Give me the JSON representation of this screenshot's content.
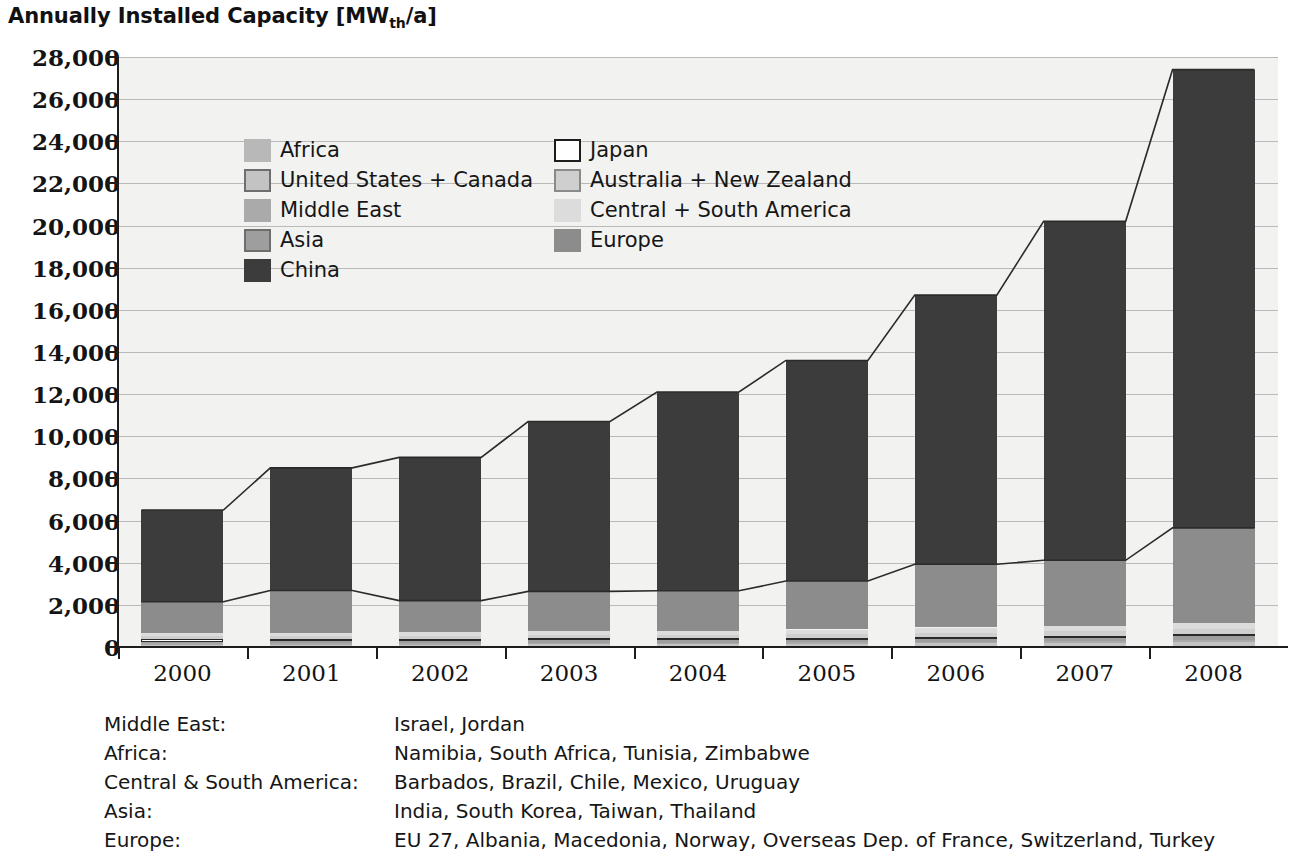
{
  "title": {
    "main": "Annually Installed Capacity [MW",
    "subscript": "th",
    "tail": "/a]"
  },
  "legend": {
    "left_column": [
      {
        "label": "Africa",
        "color": "#b8b8b8",
        "border": "none"
      },
      {
        "label": "United States + Canada",
        "color": "#c3c3c3",
        "border": "#6e6e6e"
      },
      {
        "label": "Middle East",
        "color": "#aaaaaa",
        "border": "none"
      },
      {
        "label": "Asia",
        "color": "#9e9e9e",
        "border": "#6e6e6e"
      },
      {
        "label": "China",
        "color": "#3c3c3c",
        "border": "none"
      }
    ],
    "right_column": [
      {
        "label": "Japan",
        "color": "#ffffff",
        "border": "#1d1d1d"
      },
      {
        "label": "Australia + New Zealand",
        "color": "#cfcfcf",
        "border": "#8a8a8a"
      },
      {
        "label": "Central + South America",
        "color": "#dcdcdc",
        "border": "none"
      },
      {
        "label": "Europe",
        "color": "#8c8c8c",
        "border": "none"
      }
    ]
  },
  "footnotes": [
    {
      "key": "Middle East:",
      "value": "Israel, Jordan"
    },
    {
      "key": "Africa:",
      "value": "Namibia, South Africa, Tunisia, Zimbabwe"
    },
    {
      "key": "Central & South America:",
      "value": "Barbados, Brazil, Chile, Mexico, Uruguay"
    },
    {
      "key": "Asia:",
      "value": "India, South Korea, Taiwan, Thailand"
    },
    {
      "key": "Europe:",
      "value": "EU 27, Albania, Macedonia, Norway, Overseas Dep. of France, Switzerland, Turkey"
    }
  ],
  "chart_data": {
    "type": "bar",
    "stacked": true,
    "title": "Annually Installed Capacity [MWth/a]",
    "xlabel": "",
    "ylabel": "Annually Installed Capacity [MWth/a]",
    "categories": [
      "2000",
      "2001",
      "2002",
      "2003",
      "2004",
      "2005",
      "2006",
      "2007",
      "2008"
    ],
    "ylim": [
      0,
      28000
    ],
    "ytick_step": 2000,
    "yticks": [
      0,
      2000,
      4000,
      6000,
      8000,
      10000,
      12000,
      14000,
      16000,
      18000,
      20000,
      22000,
      24000,
      26000,
      28000
    ],
    "ytick_labels": [
      "0",
      "2,000",
      "4,000",
      "6,000",
      "8,000",
      "10,000",
      "12,000",
      "14,000",
      "16,000",
      "18,000",
      "20,000",
      "22,000",
      "24,000",
      "26,000",
      "28,000"
    ],
    "grid": true,
    "legend_position": "upper-left-inside",
    "stack_order_bottom_to_top": [
      "Africa",
      "United States + Canada",
      "Middle East",
      "Asia",
      "Japan",
      "Australia + New Zealand",
      "Central + South America",
      "Europe",
      "China"
    ],
    "series": [
      {
        "name": "Africa",
        "color": "#b8b8b8",
        "values": [
          40,
          45,
          45,
          50,
          50,
          55,
          60,
          60,
          65
        ]
      },
      {
        "name": "United States + Canada",
        "color": "#c3c3c3",
        "values": [
          60,
          65,
          70,
          75,
          80,
          90,
          110,
          130,
          160
        ]
      },
      {
        "name": "Middle East",
        "color": "#aaaaaa",
        "values": [
          70,
          75,
          75,
          80,
          80,
          85,
          90,
          95,
          100
        ]
      },
      {
        "name": "Asia",
        "color": "#9e9e9e",
        "values": [
          90,
          95,
          100,
          105,
          110,
          120,
          140,
          160,
          190
        ]
      },
      {
        "name": "Japan",
        "color": "#ffffff",
        "values": [
          120,
          115,
          110,
          105,
          100,
          95,
          90,
          85,
          80
        ]
      },
      {
        "name": "Australia + New Zealand",
        "color": "#cfcfcf",
        "values": [
          130,
          135,
          140,
          150,
          160,
          175,
          195,
          215,
          240
        ]
      },
      {
        "name": "Central + South America",
        "color": "#dcdcdc",
        "values": [
          140,
          150,
          160,
          175,
          190,
          210,
          240,
          270,
          320
        ]
      },
      {
        "name": "Europe",
        "color": "#8c8c8c",
        "values": [
          1500,
          2000,
          1500,
          1900,
          1900,
          2300,
          3000,
          3100,
          4500
        ]
      },
      {
        "name": "China",
        "color": "#3c3c3c",
        "values": [
          4350,
          5820,
          6800,
          8060,
          9430,
          10470,
          12775,
          16085,
          21745
        ]
      }
    ],
    "totals": [
      6500,
      8500,
      9000,
      10700,
      12100,
      13600,
      16700,
      20200,
      27700
    ],
    "annotations": [
      "Outline polyline traces the top of each stacked bar across years",
      "Second polyline traces the top of the Europe segment across years"
    ]
  }
}
